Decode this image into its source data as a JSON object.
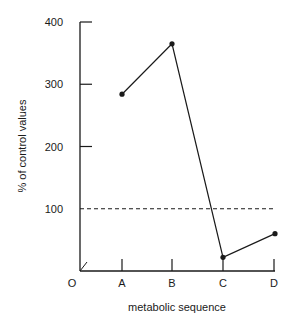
{
  "chart_data": {
    "type": "line",
    "title": "",
    "xlabel": "metabolic sequence",
    "ylabel": "% of control values",
    "origin_label": "O",
    "categories": [
      "A",
      "B",
      "C",
      "D"
    ],
    "series": [
      {
        "name": "metabolite level",
        "values": [
          284,
          365,
          22,
          60
        ],
        "marker": "dot"
      }
    ],
    "reference_line": {
      "value": 100,
      "style": "dashed"
    },
    "ylim": [
      0,
      400
    ],
    "yticks": [
      100,
      200,
      300,
      400
    ],
    "ytick_labels": [
      "100",
      "200",
      "300",
      "400"
    ],
    "grid": false,
    "legend": null
  },
  "colors": {
    "ink": "#1a1a1a",
    "background": "#ffffff"
  }
}
